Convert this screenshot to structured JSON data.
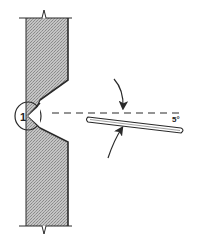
{
  "diagram": {
    "type": "technical-illustration",
    "labels": {
      "callout_number": "1",
      "angle": "5°"
    },
    "colors": {
      "line": "#2a2a2a",
      "hatch_fill": "#b0b0b0",
      "background": "#ffffff"
    }
  }
}
